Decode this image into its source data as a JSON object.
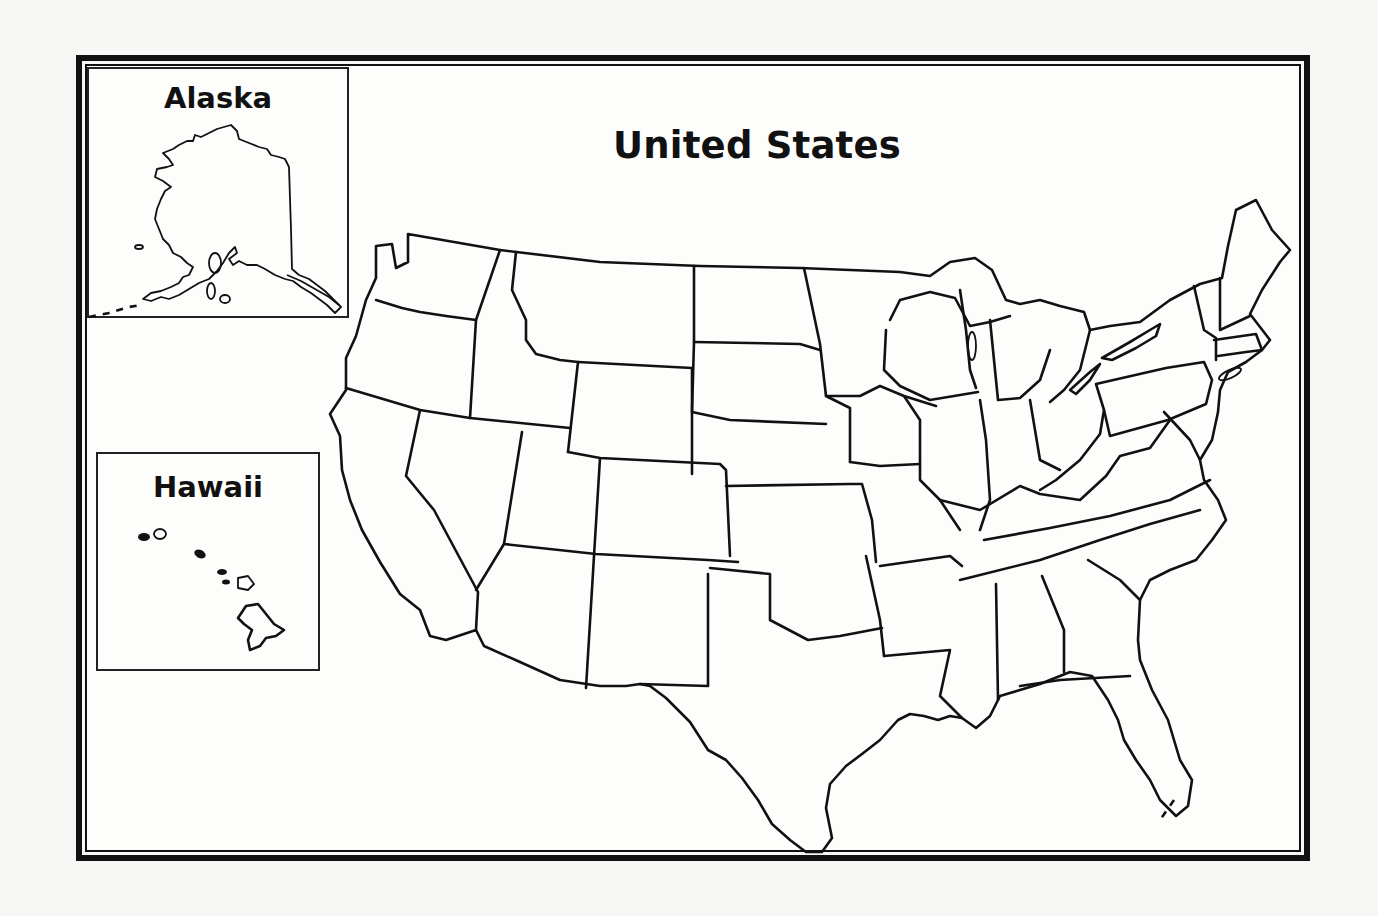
{
  "map": {
    "title": "United States",
    "insets": {
      "alaska": {
        "label": "Alaska"
      },
      "hawaii": {
        "label": "Hawaii"
      }
    },
    "style": {
      "line_color": "#111111",
      "paper_color": "#fdfdfc"
    },
    "regions": [
      "contiguous-us",
      "alaska",
      "hawaii"
    ]
  }
}
